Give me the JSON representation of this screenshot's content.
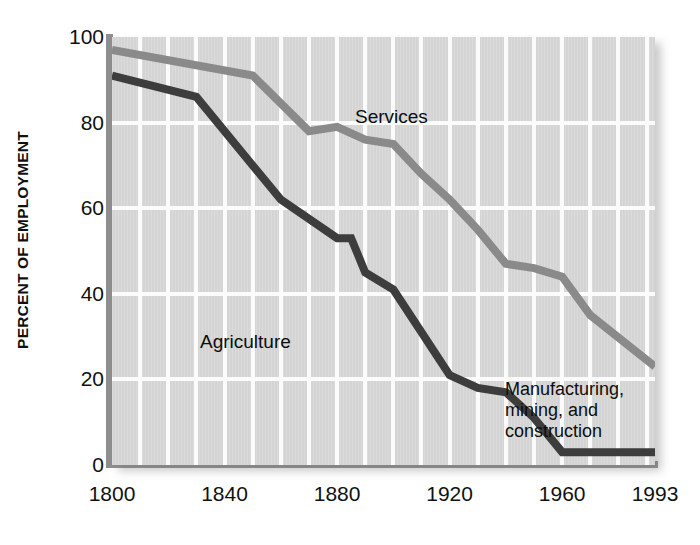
{
  "chart_data": {
    "type": "line",
    "title": "",
    "xlabel": "",
    "ylabel": "PERCENT OF EMPLOYMENT",
    "xlim": [
      1800,
      1993
    ],
    "ylim": [
      0,
      100
    ],
    "grid": true,
    "legend_position": "inline-annotations",
    "xticks": [
      {
        "value": 1800,
        "label": "1800"
      },
      {
        "value": 1840,
        "label": "1840"
      },
      {
        "value": 1880,
        "label": "1880"
      },
      {
        "value": 1920,
        "label": "1920"
      },
      {
        "value": 1960,
        "label": "1960"
      },
      {
        "value": 1993,
        "label": "1993"
      }
    ],
    "yticks": [
      {
        "value": 0,
        "label": "0"
      },
      {
        "value": 20,
        "label": "20"
      },
      {
        "value": 40,
        "label": "40"
      },
      {
        "value": 60,
        "label": "60"
      },
      {
        "value": 80,
        "label": "80"
      },
      {
        "value": 100,
        "label": "100"
      }
    ],
    "gridlines_x": [
      1810,
      1820,
      1830,
      1840,
      1850,
      1860,
      1870,
      1880,
      1890,
      1900,
      1910,
      1920,
      1930,
      1940,
      1950,
      1960,
      1970,
      1980,
      1990
    ],
    "gridlines_y": [
      20,
      40,
      60,
      80
    ],
    "series": [
      {
        "name": "Services",
        "color": "#8a8a8a",
        "x": [
          1800,
          1850,
          1870,
          1880,
          1890,
          1900,
          1910,
          1920,
          1930,
          1940,
          1950,
          1960,
          1970,
          1993
        ],
        "values": [
          97,
          91,
          78,
          79,
          76,
          75,
          68,
          62,
          55,
          47,
          46,
          44,
          35,
          23
        ]
      },
      {
        "name": "Agriculture",
        "color": "#3d3d3d",
        "x": [
          1800,
          1830,
          1860,
          1880,
          1885,
          1890,
          1900,
          1910,
          1920,
          1930,
          1940,
          1950,
          1960,
          1993
        ],
        "values": [
          91,
          86,
          62,
          53,
          53,
          45,
          41,
          31,
          21,
          18,
          17,
          11,
          3,
          3
        ]
      }
    ],
    "annotations": [
      {
        "id": "services",
        "text": "Services"
      },
      {
        "id": "agriculture",
        "text": "Agriculture"
      },
      {
        "id": "mmc",
        "text": "Manufacturing,\nmining, and\nconstruction"
      }
    ],
    "colors": {
      "plot_background": "#d4d4d4",
      "gridline": "#fbfbfb",
      "axis_rule": "#8e8e8e",
      "services_line": "#8a8a8a",
      "agriculture_line": "#3d3d3d",
      "text": "#111111",
      "page_background": "#ffffff"
    }
  }
}
